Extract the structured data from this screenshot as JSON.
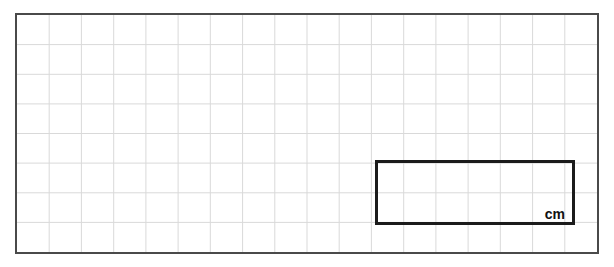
{
  "page": {
    "width": 614,
    "height": 267,
    "background_color": "#ffffff"
  },
  "grid_panel": {
    "name": "centimetre-grid",
    "left": 15,
    "top": 13,
    "width": 584,
    "height": 241,
    "border_color": "#4a4a4a",
    "border_width": 2,
    "line_color": "#d9d9d9",
    "line_width": 1,
    "columns": 18,
    "rows": 8,
    "cell_width": 32.44,
    "cell_height": 30.1
  },
  "shape": {
    "name": "rectangle",
    "type": "rectangle",
    "left": 375,
    "top": 160,
    "width": 200,
    "height": 65,
    "width_cells": 6,
    "height_cells": 2,
    "stroke_color": "#1b1b1b",
    "stroke_width": 3,
    "fill": "none",
    "unit_label": "cm"
  }
}
